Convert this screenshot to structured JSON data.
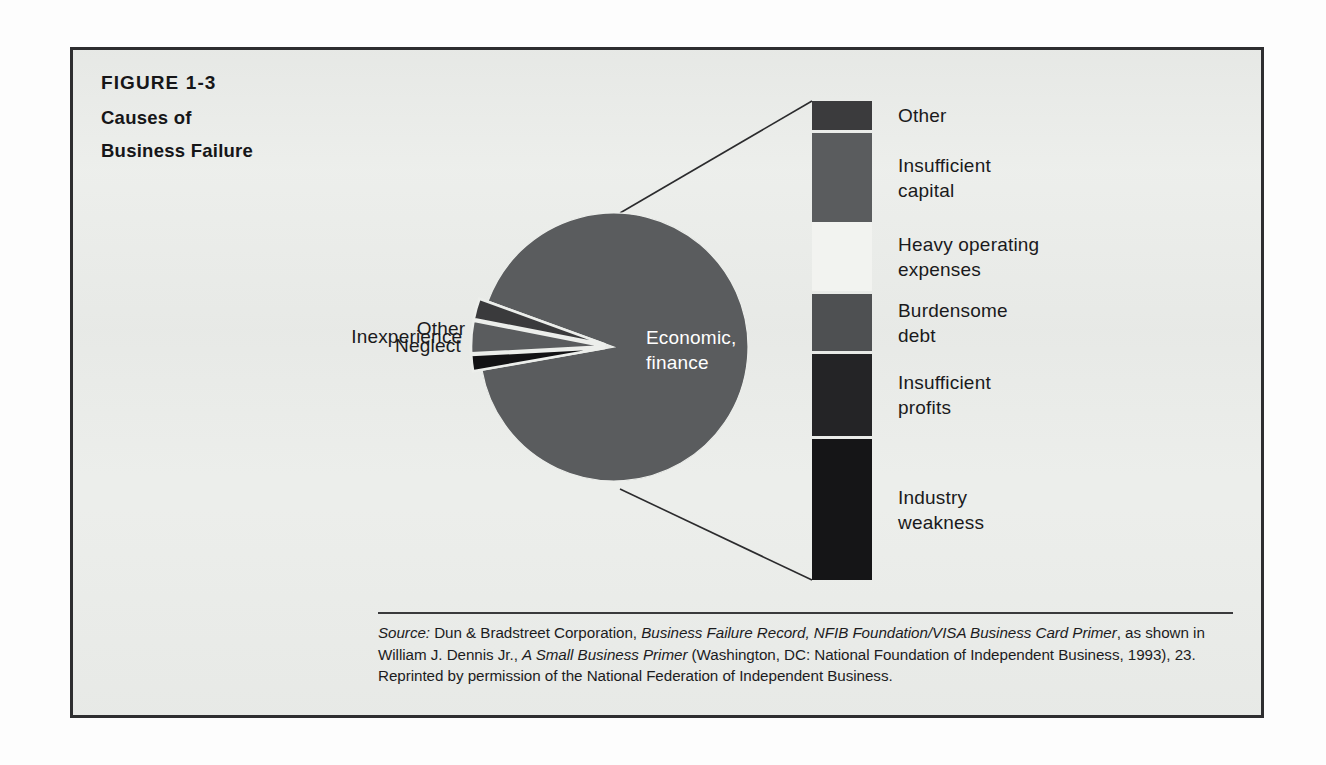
{
  "figure": {
    "number": "FIGURE 1-3",
    "title_lines": [
      "Causes of",
      "Business Failure"
    ]
  },
  "chart_data": {
    "type": "pie",
    "title": "Causes of Business Failure",
    "categories": [
      "Economic, finance",
      "Neglect",
      "Inexperience",
      "Other"
    ],
    "values": [
      88,
      1.8,
      5.8,
      4.4
    ],
    "legend_position": "callout-labels",
    "grid": false,
    "pie": {
      "center": [
        614,
        347
      ],
      "radius": 134,
      "slices": [
        {
          "label": "Economic, finance",
          "value": 88,
          "color": "#5a5c5e",
          "start_angle_deg": 200,
          "end_angle_deg": 530,
          "exploded": false,
          "label_placement": "inside-white"
        },
        {
          "label": "Neglect",
          "value": 1.8,
          "color": "#121214",
          "start_angle_deg": 170,
          "end_angle_deg": 177,
          "exploded": true,
          "label_placement": "outside-left"
        },
        {
          "label": "Inexperience",
          "value": 5.8,
          "color": "#5a5c5e",
          "start_angle_deg": 177,
          "end_angle_deg": 191,
          "exploded": true,
          "label_placement": "outside-left"
        },
        {
          "label": "Other",
          "value": 4.4,
          "color": "#3a3a3c",
          "start_angle_deg": 191,
          "end_angle_deg": 200,
          "exploded": true,
          "label_placement": "outside-left"
        }
      ]
    },
    "breakout_bar": {
      "description": "Exploded breakout of the Economic, finance slice",
      "x": 812,
      "width": 60,
      "top": 101,
      "bottom": 580,
      "segments": [
        {
          "label": "Other",
          "color": "#3b3b3d",
          "top": 101,
          "bottom": 130
        },
        {
          "label": "Insufficient\ncapital",
          "color": "#5a5c5e",
          "top": 133,
          "bottom": 222
        },
        {
          "label": "Heavy operating\nexpenses",
          "color": "#f2f3f0",
          "top": 222,
          "bottom": 291
        },
        {
          "label": "Burdensome\ndebt",
          "color": "#4e5052",
          "top": 294,
          "bottom": 351
        },
        {
          "label": "Insufficient\nprofits",
          "color": "#242426",
          "top": 354,
          "bottom": 436
        },
        {
          "label": "Industry\nweakness",
          "color": "#151517",
          "top": 439,
          "bottom": 580
        }
      ]
    },
    "callout_lines": [
      {
        "from": [
          620,
          213
        ],
        "to": [
          812,
          101
        ]
      },
      {
        "from": [
          620,
          489
        ],
        "to": [
          812,
          580
        ]
      }
    ]
  },
  "source": {
    "prefix": "Source:",
    "segments": [
      {
        "text": " Dun & Bradstreet Corporation, ",
        "italic": false
      },
      {
        "text": "Business Failure Record, NFIB Foundation/VISA Business Card Primer",
        "italic": true
      },
      {
        "text": ", as shown in William J. Dennis Jr., ",
        "italic": false
      },
      {
        "text": "A Small Business Primer",
        "italic": true
      },
      {
        "text": " (Washington, DC: National Foundation of Independent Business, 1993), 23. Reprinted by permission of the National Federation of Independent Business.",
        "italic": false
      }
    ]
  },
  "colors": {
    "page_background": "#fdfdfd",
    "figure_background": "#eceeeb",
    "frame_border": "#2e2e30",
    "text": "#1a1a1c",
    "rule": "#3a3a3c"
  }
}
